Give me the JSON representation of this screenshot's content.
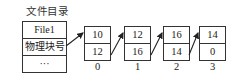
{
  "directory": {
    "title": "文件目录",
    "rows": [
      "File1",
      "物理块号",
      "···"
    ]
  },
  "blocks": [
    {
      "index": "0",
      "top": "10",
      "bottom": "12"
    },
    {
      "index": "1",
      "top": "12",
      "bottom": "16"
    },
    {
      "index": "2",
      "top": "16",
      "bottom": "14"
    },
    {
      "index": "3",
      "top": "14",
      "bottom": "0"
    }
  ],
  "colors": {
    "line": "#333333",
    "background": "#ffffff"
  }
}
